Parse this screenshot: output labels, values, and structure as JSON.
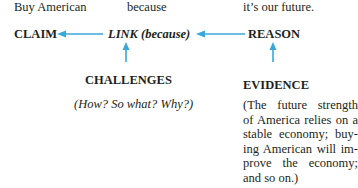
{
  "sentence": {
    "claim_text": "Buy American",
    "link_text": "because",
    "reason_text": "it’s our future."
  },
  "nodes": {
    "claim": "CLAIM",
    "link": "LINK (because)",
    "reason": "REASON",
    "challenges": "CHALLENGES",
    "challenges_note": "(How? So what? Why?)",
    "evidence": "EVIDENCE",
    "evidence_note_lines": [
      "(The future strength",
      "of America relies on a",
      "stable economy; buy-",
      "ing American will im-",
      "prove the economy;",
      "and so on.)"
    ]
  },
  "colors": {
    "arrow": "#3aa7d9",
    "text": "#231f20"
  }
}
